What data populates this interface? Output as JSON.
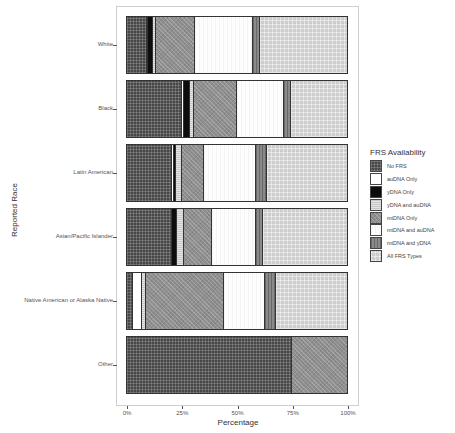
{
  "chart_data": {
    "type": "bar",
    "orientation": "horizontal",
    "stacked": "percent",
    "title": "",
    "xlabel": "Percentage",
    "ylabel": "Reported Race",
    "xlim": [
      0,
      100
    ],
    "x_ticks": [
      "0%",
      "25%",
      "50%",
      "75%",
      "100%"
    ],
    "grid": false,
    "legend_position": "right",
    "legend_title": "FRS Availability",
    "categories": [
      "White",
      "Black",
      "Latin American",
      "Asian/Pacific Islander",
      "Native American or Alaska Native",
      "Other"
    ],
    "series": [
      {
        "name": "No FRS",
        "pattern": "p-nofrs",
        "values": [
          9.0,
          25.0,
          20.5,
          20.5,
          2.5,
          75.0
        ]
      },
      {
        "name": "auDNA Only",
        "pattern": "p-audna",
        "values": [
          0.5,
          1.0,
          0.7,
          0.0,
          4.5,
          0.0
        ]
      },
      {
        "name": "yDNA Only",
        "pattern": "p-ydna",
        "values": [
          2.3,
          2.7,
          1.0,
          2.3,
          0.0,
          0.0
        ]
      },
      {
        "name": "yDNA and auDNA",
        "pattern": "p-ydnaau",
        "values": [
          1.3,
          1.8,
          3.0,
          3.2,
          1.8,
          0.0
        ]
      },
      {
        "name": "mtDNA Only",
        "pattern": "p-mtdna",
        "values": [
          18.0,
          19.5,
          10.0,
          12.5,
          35.5,
          25.0
        ]
      },
      {
        "name": "mtDNA and auDNA",
        "pattern": "p-mtau",
        "values": [
          26.0,
          21.5,
          23.5,
          20.0,
          18.5,
          0.0
        ]
      },
      {
        "name": "mtDNA and yDNA",
        "pattern": "p-mty",
        "values": [
          3.6,
          3.0,
          4.8,
          3.5,
          5.0,
          0.0
        ]
      },
      {
        "name": "All FRS Types",
        "pattern": "p-all",
        "values": [
          39.3,
          25.5,
          36.5,
          38.0,
          32.2,
          0.0
        ]
      }
    ]
  }
}
